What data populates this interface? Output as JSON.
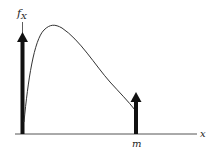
{
  "diagram": {
    "y_axis_label": "f",
    "y_axis_label_subscript": "X",
    "x_axis_label": "x",
    "x_tick_label": "m",
    "colors": {
      "ink": "#111111",
      "curve": "#333333",
      "axis": "#555555",
      "background": "#ffffff"
    },
    "elements": [
      {
        "type": "impulse",
        "position": "0",
        "description": "point mass at x = 0 (tall arrow)"
      },
      {
        "type": "density-curve",
        "description": "continuous density rising from 0, peaking early, then decaying toward m"
      },
      {
        "type": "impulse",
        "position": "m",
        "description": "point mass at x = m (shorter arrow)"
      }
    ]
  }
}
